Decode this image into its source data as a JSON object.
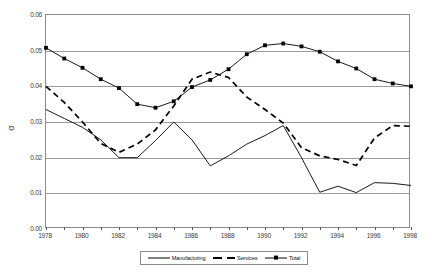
{
  "axes": {
    "ylabel": "σ",
    "yticks": [
      "0.00",
      "0.01",
      "0.02",
      "0.03",
      "0.04",
      "0.05",
      "0.06"
    ],
    "xticks": [
      "1978",
      "1980",
      "1982",
      "1984",
      "1986",
      "1988",
      "1990",
      "1992",
      "1994",
      "1996",
      "1998"
    ]
  },
  "legend": {
    "items": [
      {
        "label": "Manufacturing",
        "style": "solid",
        "marker": "none",
        "color": "#000000"
      },
      {
        "label": "Services",
        "style": "dashed",
        "marker": "none",
        "color": "#000000"
      },
      {
        "label": "Total",
        "style": "solid",
        "marker": "square",
        "color": "#000000"
      }
    ]
  },
  "chart_data": {
    "type": "line",
    "title": "",
    "xlabel": "",
    "ylabel": "σ",
    "xlim": [
      1978,
      1998
    ],
    "ylim": [
      0.0,
      0.06
    ],
    "ytick_step": 0.01,
    "grid": "horizontal",
    "legend_position": "bottom",
    "x": [
      1978,
      1979,
      1980,
      1981,
      1982,
      1983,
      1984,
      1985,
      1986,
      1987,
      1988,
      1989,
      1990,
      1991,
      1992,
      1993,
      1994,
      1995,
      1996,
      1997,
      1998
    ],
    "series": [
      {
        "name": "Manufacturing",
        "style": "solid",
        "marker": "none",
        "values": [
          0.0335,
          0.031,
          0.0285,
          0.025,
          0.02,
          0.02,
          0.0248,
          0.03,
          0.025,
          0.0177,
          0.0205,
          0.0238,
          0.0262,
          0.029,
          0.02,
          0.0103,
          0.012,
          0.0102,
          0.013,
          0.0128,
          0.0122
        ]
      },
      {
        "name": "Services",
        "style": "dashed",
        "marker": "none",
        "values": [
          0.04,
          0.0355,
          0.03,
          0.024,
          0.0215,
          0.0238,
          0.0278,
          0.0345,
          0.042,
          0.044,
          0.0425,
          0.037,
          0.0335,
          0.0297,
          0.0228,
          0.0205,
          0.0195,
          0.0178,
          0.0255,
          0.029,
          0.0288
        ]
      },
      {
        "name": "Total",
        "style": "solid",
        "marker": "square",
        "values": [
          0.0508,
          0.0478,
          0.0452,
          0.042,
          0.0395,
          0.035,
          0.034,
          0.0358,
          0.0398,
          0.0418,
          0.0448,
          0.049,
          0.0515,
          0.052,
          0.0512,
          0.0497,
          0.047,
          0.045,
          0.042,
          0.0408,
          0.04
        ]
      }
    ]
  }
}
